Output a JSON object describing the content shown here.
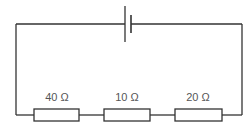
{
  "diagram": {
    "type": "series circuit",
    "components": {
      "cell": {
        "symbol": "battery"
      },
      "resistors": [
        {
          "label": "40 Ω",
          "value": 40
        },
        {
          "label": "10 Ω",
          "value": 10
        },
        {
          "label": "20 Ω",
          "value": 20
        }
      ]
    },
    "colors": {
      "wire": "#333333",
      "text": "#555555",
      "background": "#ffffff"
    }
  }
}
